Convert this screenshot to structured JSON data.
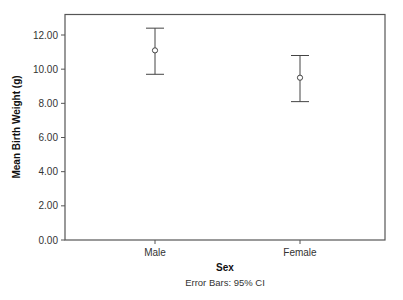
{
  "chart_data": {
    "type": "errorbar",
    "title": "",
    "xlabel": "Sex",
    "ylabel": "Mean Birth Weight (g)",
    "footnote": "Error Bars: 95% CI",
    "categories": [
      "Male",
      "Female"
    ],
    "series": [
      {
        "name": "Mean Birth Weight (g)",
        "values": [
          11.1,
          9.5
        ],
        "ci_lower": [
          9.7,
          8.1
        ],
        "ci_upper": [
          12.4,
          10.8
        ]
      }
    ],
    "ylim": [
      0,
      13.2
    ],
    "yticks": [
      0,
      2,
      4,
      6,
      8,
      10,
      12
    ],
    "ytick_labels": [
      "0.00",
      "2.00",
      "4.00",
      "6.00",
      "8.00",
      "10.00",
      "12.00"
    ],
    "grid": false,
    "legend": null
  },
  "colors": {
    "axis": "#555555",
    "marker": "#444444",
    "errorbar": "#444444"
  }
}
